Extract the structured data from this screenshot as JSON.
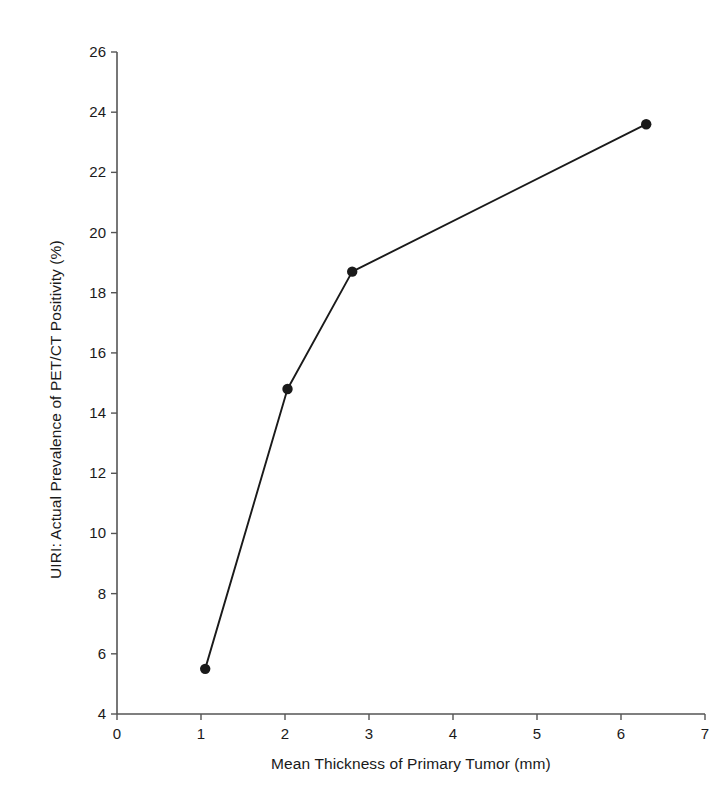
{
  "chart_data": {
    "type": "line",
    "title": "",
    "subtitle": "",
    "xlabel": "Mean Thickness of Primary Tumor (mm)",
    "ylabel": "UIRI: Actual Prevalence of PET/CT Positivity (%)",
    "xlim": [
      0,
      7
    ],
    "ylim": [
      4,
      26
    ],
    "xticks": [
      0,
      1,
      2,
      3,
      4,
      5,
      6,
      7
    ],
    "yticks": [
      4,
      6,
      8,
      10,
      12,
      14,
      16,
      18,
      20,
      22,
      24,
      26
    ],
    "xtick_labels": [
      "0",
      "1",
      "2",
      "3",
      "4",
      "5",
      "6",
      "7"
    ],
    "ytick_labels": [
      "4",
      "6",
      "8",
      "10",
      "12",
      "14",
      "16",
      "18",
      "20",
      "22",
      "24",
      "26"
    ],
    "grid": false,
    "legend": null,
    "legend_position": "none",
    "marker": "circle",
    "marker_color": "#1a1a1a",
    "line_color": "#1a1a1a",
    "series": [
      {
        "name": "UIRI",
        "x": [
          1.05,
          2.03,
          2.8,
          6.3
        ],
        "y": [
          5.5,
          14.8,
          18.7,
          23.6
        ]
      }
    ],
    "annotations": []
  },
  "axes": {
    "axis_color": "#555555",
    "tick_color": "#555555"
  }
}
